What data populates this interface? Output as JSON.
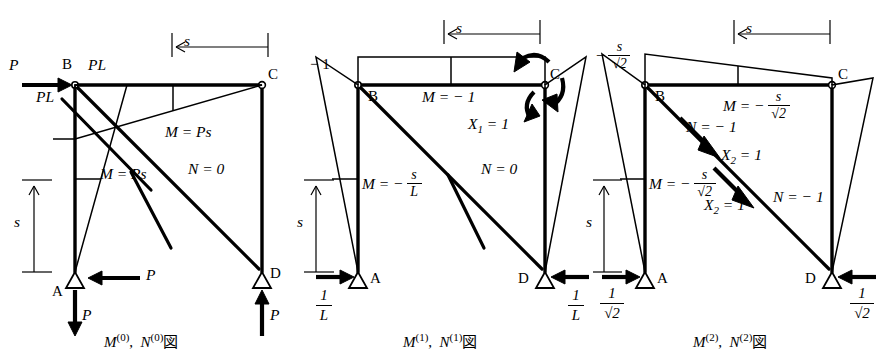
{
  "figure": {
    "title_absent": true,
    "panels": [
      {
        "id": "panel-0",
        "caption_M": "M",
        "caption_M_sup": "(0)",
        "caption_N": "N",
        "caption_N_sup": "(1)",
        "caption": "M(0),  N(0)図",
        "caption_parts": {
          "m": "M",
          "m_sup": "(0)",
          "comma": ",",
          "n": "N",
          "n_sup": "(0)",
          "zu": "図"
        },
        "nodes": [
          {
            "name": "A",
            "label": "A"
          },
          {
            "name": "B",
            "label": "B"
          },
          {
            "name": "C",
            "label": "C"
          },
          {
            "name": "D",
            "label": "D"
          }
        ],
        "loads": [
          {
            "name": "applied-load-P-top",
            "label": "P",
            "dir": "right"
          },
          {
            "name": "reaction-P-horizontal-A",
            "label": "P",
            "dir": "left"
          },
          {
            "name": "reaction-P-vertical-A",
            "label": "P",
            "dir": "down"
          },
          {
            "name": "reaction-P-vertical-D",
            "label": "P",
            "dir": "up"
          }
        ],
        "annotations": [
          {
            "name": "moment-label-beam-b-top",
            "label": "PL"
          },
          {
            "name": "moment-label-column-b",
            "label": "PL"
          },
          {
            "name": "moment-label-beam",
            "label": "M = Ps"
          },
          {
            "name": "moment-label-column",
            "label": "M = Ps"
          },
          {
            "name": "axial-label-diagonal",
            "label": "N = 0"
          }
        ],
        "dimensions": [
          {
            "name": "dim-s-horizontal",
            "label": "s"
          },
          {
            "name": "dim-s-vertical",
            "label": "s"
          }
        ]
      },
      {
        "id": "panel-1",
        "caption_parts": {
          "m": "M",
          "m_sup": "(1)",
          "comma": ",",
          "n": "N",
          "n_sup": "(1)",
          "zu": "図"
        },
        "nodes": [
          {
            "name": "A",
            "label": "A"
          },
          {
            "name": "B",
            "label": "B"
          },
          {
            "name": "C",
            "label": "C"
          },
          {
            "name": "D",
            "label": "D"
          }
        ],
        "loads": [
          {
            "name": "unit-moment-X1",
            "label": "X",
            "sub": "1",
            "eq": "= 1"
          },
          {
            "name": "reaction-A",
            "num": "1",
            "den": "L",
            "dir": "right"
          },
          {
            "name": "reaction-D",
            "num": "1",
            "den": "L",
            "dir": "left"
          }
        ],
        "annotations": [
          {
            "name": "moment-label-column-top",
            "label": "− 1"
          },
          {
            "name": "moment-label-beam",
            "label": "M = − 1"
          },
          {
            "name": "moment-label-column",
            "pre": "M = −",
            "num": "s",
            "den": "L"
          },
          {
            "name": "axial-label-diagonal",
            "label": "N = 0"
          }
        ],
        "dimensions": [
          {
            "name": "dim-s-horizontal",
            "label": "s"
          },
          {
            "name": "dim-s-vertical",
            "label": "s"
          }
        ]
      },
      {
        "id": "panel-2",
        "caption_parts": {
          "m": "M",
          "m_sup": "(2)",
          "comma": ",",
          "n": "N",
          "n_sup": "(2)",
          "zu": "図"
        },
        "nodes": [
          {
            "name": "A",
            "label": "A"
          },
          {
            "name": "B",
            "label": "B"
          },
          {
            "name": "C",
            "label": "C"
          },
          {
            "name": "D",
            "label": "D"
          }
        ],
        "loads": [
          {
            "name": "unit-force-X2-upper",
            "label": "X",
            "sub": "2",
            "eq": "= 1"
          },
          {
            "name": "unit-force-X2-lower",
            "label": "X",
            "sub": "2",
            "eq": "= 1"
          },
          {
            "name": "reaction-A",
            "num": "1",
            "den": "√2",
            "dir": "right"
          },
          {
            "name": "reaction-D",
            "num": "1",
            "den": "√2",
            "dir": "left"
          }
        ],
        "annotations": [
          {
            "name": "moment-label-column-top",
            "pre": "−",
            "num": "s",
            "den": "√2"
          },
          {
            "name": "moment-label-beam",
            "pre": "M = −",
            "num": "s",
            "den": "√2"
          },
          {
            "name": "moment-label-column",
            "pre": "M = −",
            "num": "s",
            "den": "√2"
          },
          {
            "name": "axial-label-diagonal-upper",
            "label": "N = − 1"
          },
          {
            "name": "axial-label-diagonal-lower",
            "label": "N = − 1"
          }
        ],
        "dimensions": [
          {
            "name": "dim-s-horizontal",
            "label": "s"
          },
          {
            "name": "dim-s-vertical",
            "label": "s"
          }
        ]
      }
    ],
    "symbols": {
      "sqrt": "√",
      "minus": "−",
      "equals": "=",
      "zu": "図",
      "comma": ","
    },
    "colors": {
      "ink": "#000000",
      "paper": "#ffffff"
    }
  }
}
